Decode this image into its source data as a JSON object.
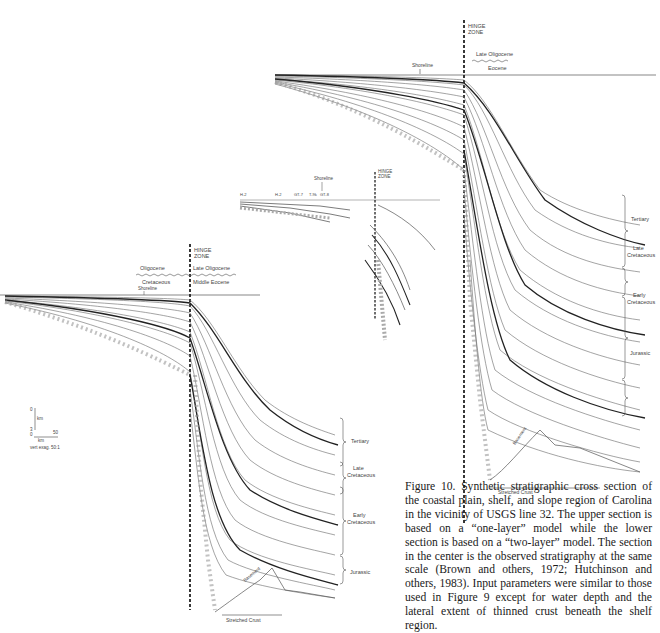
{
  "figure": {
    "caption": "Figure 10. Synthetic stratigraphic cross section of the coastal plain, shelf, and slope region of Carolina in the vicinity of USGS line 32. The upper section is based on a “one-layer” model while the lower section is based on a “two-layer” model. The section in the center is the observed stratigraphy at the same scale (Brown and others, 1972; Hutchinson and others, 1983). Input parameters were similar to those used in Figure 9 except for water depth and the lateral extent of thinned crust beneath the shelf region."
  },
  "upper_section": {
    "model": "one-layer",
    "hinge_label_1": "HINGE",
    "hinge_label_2": "ZONE",
    "shoreline": "Shoreline",
    "unconformity_top": "Late Oligocene",
    "unconformity_bottom": "Eocene",
    "age_brackets": [
      "Tertiary",
      "Late",
      "Cretaceous",
      "Early",
      "Cretaceous",
      "Jurassic"
    ],
    "basement": "Basement",
    "stretched_crust": "Stretched Crust"
  },
  "center_section": {
    "model": "observed",
    "hinge_label_1": "HINGE",
    "hinge_label_2": "ZONE",
    "shoreline": "Shoreline",
    "wells": [
      "H-2",
      "H-2",
      "GT-7",
      "T-9k",
      "GT-8"
    ],
    "units": [
      "Lower Cret.",
      "Jurassic (?)",
      "Upper Cretaceous",
      "Lower Cretaceous",
      "Tertiary (Unconformable)"
    ]
  },
  "lower_section": {
    "model": "two-layer",
    "hinge_label_1": "HINGE",
    "hinge_label_2": "ZONE",
    "shoreline": "Shoreline",
    "unconformity_left_top": "Oligocene",
    "unconformity_left_bottom": "Cretaceous",
    "unconformity_right_top": "Late  Oligocene",
    "unconformity_right_bottom": "Middle  Eocene",
    "age_brackets": [
      "Tertiary",
      "Late",
      "Cretaceous",
      "Early",
      "Cretaceous",
      "Jurassic"
    ],
    "basement": "Basement",
    "stretched_crust": "Stretched Crust"
  },
  "scale_bar": {
    "vertical_top": "0",
    "vertical_unit": "km",
    "vertical_bottom": "3",
    "horizontal_left": "0",
    "horizontal_right": "50",
    "horizontal_unit": "km",
    "exaggeration": "vert exag. 50:1"
  }
}
